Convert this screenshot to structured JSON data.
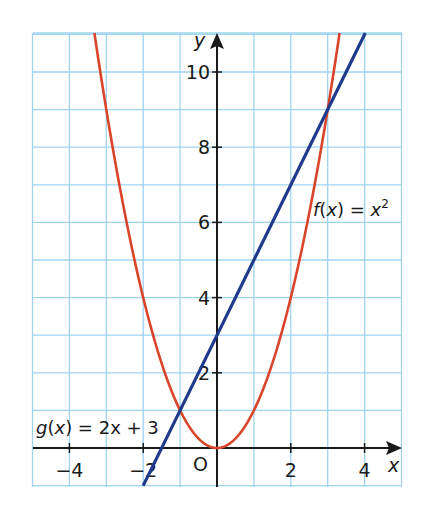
{
  "chart_data": {
    "type": "line",
    "title": "",
    "xlabel": "x",
    "ylabel": "y",
    "origin_label": "O",
    "xlim": [
      -5,
      5
    ],
    "ylim": [
      -1,
      11
    ],
    "grid": true,
    "x_ticks": [
      -4,
      -2,
      2,
      4
    ],
    "y_ticks": [
      2,
      4,
      6,
      8,
      10
    ],
    "x_tick_labels": [
      "−4",
      "−2",
      "2",
      "4"
    ],
    "y_tick_labels": [
      "2",
      "4",
      "6",
      "8",
      "10"
    ],
    "series": [
      {
        "name": "f(x) = x²",
        "label_parts": {
          "fn": "f",
          "var": "x",
          "rhs_var": "x",
          "exp": "2"
        },
        "color": "#d9452b",
        "expression": "x^2",
        "x": [
          -3.3,
          -3,
          -2,
          -1,
          0,
          1,
          2,
          3,
          3.3
        ],
        "values": [
          10.89,
          9,
          4,
          1,
          0,
          1,
          4,
          9,
          10.89
        ]
      },
      {
        "name": "g(x) = 2x + 3",
        "label_parts": {
          "fn": "g",
          "var": "x",
          "rhs": "2x + 3"
        },
        "color": "#1f3a8a",
        "expression": "2x + 3",
        "x": [
          -2,
          -1,
          0,
          1,
          2,
          3,
          4
        ],
        "values": [
          -1,
          1,
          3,
          5,
          7,
          9,
          11
        ]
      }
    ],
    "intersections": [
      {
        "x": -1,
        "y": 1
      },
      {
        "x": 3,
        "y": 9
      }
    ],
    "colors": {
      "grid": "#9fd3ef",
      "axis": "#1a1a1a"
    }
  }
}
